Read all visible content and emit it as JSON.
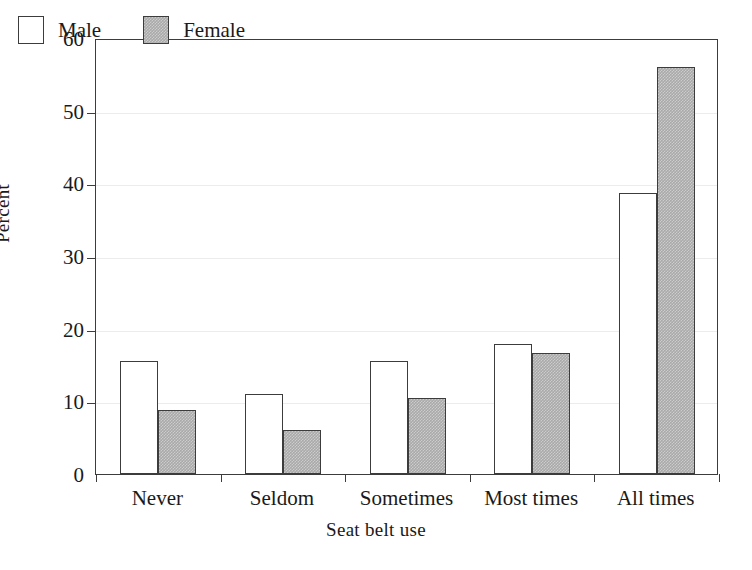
{
  "chart_data": {
    "type": "bar",
    "title": "",
    "xlabel": "Seat belt use",
    "ylabel": "Percent",
    "categories": [
      "Never",
      "Seldom",
      "Sometimes",
      "Most times",
      "All times"
    ],
    "series": [
      {
        "name": "Male",
        "color": "#ffffff",
        "values": [
          15.6,
          11.0,
          15.5,
          17.9,
          38.7
        ]
      },
      {
        "name": "Female",
        "color": "#a9a9a9",
        "values": [
          8.8,
          6.0,
          10.5,
          16.6,
          56.0
        ]
      }
    ],
    "ylim": [
      0,
      60
    ],
    "yticks": [
      0,
      10,
      20,
      30,
      40,
      50,
      60
    ],
    "ytick_labels": [
      "0",
      "10",
      "20",
      "30",
      "40",
      "50",
      "60"
    ],
    "grid": true,
    "grid_axis": "y",
    "legend_position": "upper-left-inside",
    "legend_entries": [
      "Male",
      "Female"
    ],
    "bar_outline_color": "#3c3c3c",
    "frame_color": "#3c3c3c",
    "gridline_color": "#ececec",
    "background": "#ffffff"
  }
}
